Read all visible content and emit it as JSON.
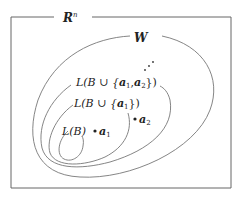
{
  "diagram": {
    "frame_label": {
      "base": "R",
      "superscript": "n"
    },
    "outer_region_label": "W",
    "ellipsis": "⋰",
    "regions": [
      {
        "label_prefix": "L(B ∪ {",
        "label_vec1": "a",
        "sub1": "1",
        "sep": ",",
        "label_vec2": "a",
        "sub2": "2",
        "label_suffix": "})"
      },
      {
        "label_prefix": "L(B ∪ {",
        "label_vec1": "a",
        "sub1": "1",
        "label_suffix": "})"
      },
      {
        "label": "L(B)"
      }
    ],
    "points": [
      {
        "name": "a",
        "sub": "1"
      },
      {
        "name": "a",
        "sub": "2"
      }
    ],
    "colors": {
      "stroke": "#555555",
      "text": "#222222",
      "background": "#ffffff"
    }
  }
}
